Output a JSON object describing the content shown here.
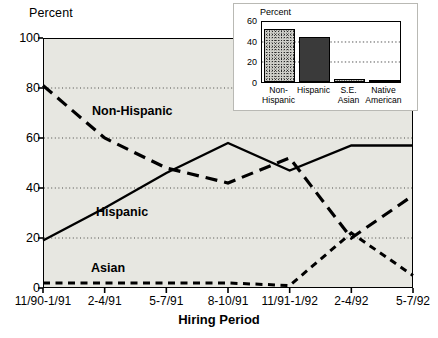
{
  "chart_data": [
    {
      "type": "line",
      "id": "main",
      "title": "",
      "xlabel": "Hiring Period",
      "ylabel": "Percent",
      "ylim": [
        0,
        100
      ],
      "yticks": [
        0,
        20,
        40,
        60,
        80,
        100
      ],
      "grid": "horizontal-dotted",
      "legend": "inline-labels",
      "categories": [
        "11/90-1/91",
        "2-4/91",
        "5-7/91",
        "8-10/91",
        "11/91-1/92",
        "2-4/92",
        "5-7/92"
      ],
      "series": [
        {
          "name": "Non-Hispanic",
          "style": "long-dash",
          "values": [
            81,
            60,
            48,
            42,
            52,
            20,
            37
          ]
        },
        {
          "name": "Hispanic",
          "style": "solid",
          "values": [
            19,
            32,
            46,
            58,
            47,
            57,
            57
          ]
        },
        {
          "name": "Asian",
          "style": "short-dash",
          "values": [
            2,
            2,
            2,
            2,
            1,
            22,
            5
          ]
        }
      ]
    },
    {
      "type": "bar",
      "id": "inset",
      "title": "",
      "ylabel": "Percent",
      "ylim": [
        0,
        60
      ],
      "yticks": [
        0,
        20,
        40,
        60
      ],
      "grid": "horizontal-dotted",
      "categories": [
        "Non-\nHispanic",
        "Hispanic",
        "S.E.\nAsian",
        "Native\nAmerican"
      ],
      "category_lines": [
        [
          "Non-",
          "Hispanic"
        ],
        [
          "Hispanic",
          ""
        ],
        [
          "S.E.",
          "Asian"
        ],
        [
          "Native",
          "American"
        ]
      ],
      "values": [
        51,
        44,
        3,
        1
      ],
      "fills": [
        "stipple",
        "solid",
        "stipple",
        "solid"
      ]
    }
  ],
  "colors": {
    "plot_background": "#e7e7e1",
    "inset_background": "#ffffff",
    "ink": "#000000",
    "bar_solid": "#3a3a3a",
    "bar_stipple": "#cfcfc9",
    "gridline": "#555555"
  }
}
